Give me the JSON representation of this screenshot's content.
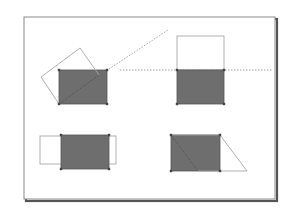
{
  "diagram": {
    "title": "",
    "colors": {
      "background": "#ffffff",
      "frame_border": "#8a8a8a",
      "frame_shadow": "#555555",
      "fill": "#6e6e6e",
      "fill_stroke": "#555555",
      "outline_stroke": "#a8a8a8",
      "dashed_stroke": "#9a9a9a",
      "corner_marker": "#444444"
    },
    "frame": {
      "x": 24,
      "y": 17,
      "width": 251,
      "height": 182,
      "shadow_offset": 2
    },
    "panels": [
      {
        "name": "rotate",
        "filled_rect": {
          "x": 59,
          "y": 70,
          "width": 48,
          "height": 34
        },
        "outline_polygon": "41,77 80,48 99,75 59,104",
        "diagonal_line": {
          "x1": 59,
          "y1": 104,
          "x2": 99,
          "y2": 75
        },
        "dashed_guide": {
          "x1": 109,
          "y1": 69,
          "x2": 168,
          "y2": 30
        }
      },
      {
        "name": "reflect",
        "filled_rect": {
          "x": 177,
          "y": 70,
          "width": 47,
          "height": 34
        },
        "outline_rect": {
          "x": 177,
          "y": 36,
          "width": 47,
          "height": 34
        },
        "dashed_guide": {
          "x1": 120,
          "y1": 70,
          "x2": 272,
          "y2": 70
        }
      },
      {
        "name": "scale",
        "filled_rect": {
          "x": 61,
          "y": 135,
          "width": 48,
          "height": 34
        },
        "outline_rect": {
          "x": 40,
          "y": 136,
          "width": 76,
          "height": 28
        }
      },
      {
        "name": "skew",
        "filled_rect": {
          "x": 171,
          "y": 135,
          "width": 49,
          "height": 36
        },
        "outline_polygon": "171,135 220,135 247,171 198,171",
        "diagonal_line": {
          "x1": 171,
          "y1": 135,
          "x2": 198,
          "y2": 171
        }
      }
    ]
  }
}
